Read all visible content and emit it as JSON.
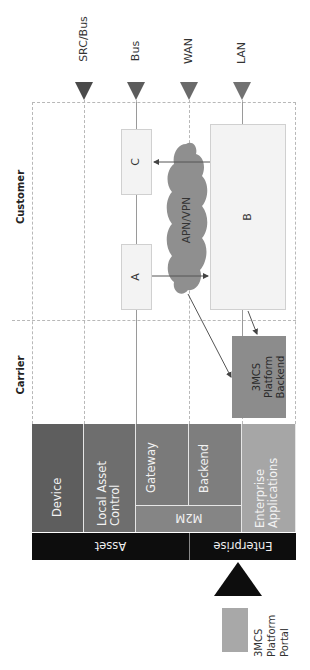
{
  "lanes": {
    "src_bus": {
      "label": "SRC/Bus",
      "color": "#4a4a4a"
    },
    "bus": {
      "label": "Bus",
      "color": "#5c5c5c"
    },
    "wan": {
      "label": "WAN",
      "color": "#6a6a6a"
    },
    "lan": {
      "label": "LAN",
      "color": "#727272"
    }
  },
  "sections": {
    "customer": "Customer",
    "carrier": "Carrier"
  },
  "nodes": {
    "a": "A",
    "b": "B",
    "c": "C",
    "cloud": "APN/VPN",
    "backend_l1": "3MCS",
    "backend_l2": "Platform",
    "backend_l3": "Backend"
  },
  "layers": {
    "device": "Device",
    "local_l1": "Local Asset",
    "local_l2": "Control",
    "gateway": "Gateway",
    "backend": "Backend",
    "m2m": "M2M",
    "enterprise_l1": "Enterprise",
    "enterprise_l2": "Applications",
    "asset_group": "Asset",
    "enterprise_group": "Enterprise"
  },
  "legend": {
    "l1": "3MCS",
    "l2": "Platform",
    "l3": "Portal",
    "swatch_color": "#a8a8a8"
  },
  "colors": {
    "device": "#5e5e5e",
    "local": "#6e6e6e",
    "gateway": "#7a7a7a",
    "backend": "#7e7e7e",
    "m2m": "#858585",
    "enterprise": "#a6a6a6",
    "black_band": "#0d0d0d",
    "cloud": "#8f8f8f",
    "backend_box": "#8c8c8c"
  }
}
